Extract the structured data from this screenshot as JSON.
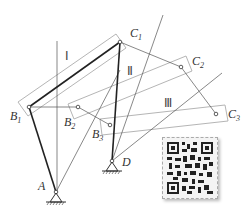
{
  "figure": {
    "type": "four-bar linkage three-position design diagram",
    "points": {
      "A": {
        "label": "A",
        "sub": ""
      },
      "D": {
        "label": "D",
        "sub": ""
      },
      "B1": {
        "label": "B",
        "sub": "1"
      },
      "B2": {
        "label": "B",
        "sub": "2"
      },
      "B3": {
        "label": "B",
        "sub": "3"
      },
      "C1": {
        "label": "C",
        "sub": "1"
      },
      "C2": {
        "label": "C",
        "sub": "2"
      },
      "C3": {
        "label": "C",
        "sub": "3"
      }
    },
    "positions": [
      "Ⅰ",
      "Ⅱ",
      "Ⅲ"
    ],
    "qr_code": "qr-code-image"
  }
}
